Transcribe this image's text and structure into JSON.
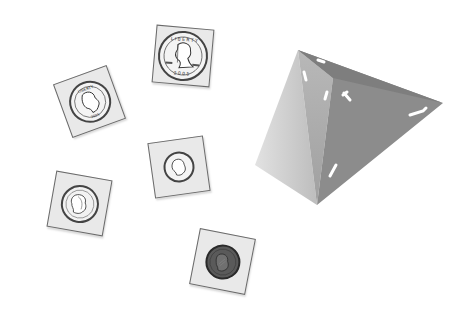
{
  "scene": {
    "description": "Five U.S. coins in cardboard coin holders and a four-sided die",
    "background": "#ffffff",
    "card_color": "#e9e9e9"
  },
  "coins": [
    {
      "name": "half dollar",
      "portrait": "Kennedy",
      "lettering_top": "LIBERTY",
      "lettering_bottom": "2005",
      "x": 183,
      "y": 56,
      "card_size": 58,
      "coin_size": 50,
      "rotate": 5,
      "fill": "#f4f4f4"
    },
    {
      "name": "quarter",
      "portrait": "Washington",
      "lettering_top": "LIBERTY",
      "x": 90,
      "y": 102,
      "card_size": 57,
      "coin_size": 42,
      "rotate": -20,
      "fill": "#f4f4f4"
    },
    {
      "name": "dime",
      "portrait": "Roosevelt",
      "x": 179,
      "y": 167,
      "card_size": 56,
      "coin_size": 31,
      "rotate": -8,
      "fill": "#f4f4f4"
    },
    {
      "name": "nickel",
      "portrait": "Jefferson",
      "x": 80,
      "y": 204,
      "card_size": 57,
      "coin_size": 38,
      "rotate": 10,
      "fill": "#f2f2f2"
    },
    {
      "name": "penny",
      "portrait": "Lincoln",
      "x": 223,
      "y": 262,
      "card_size": 57,
      "coin_size": 35,
      "rotate": 11,
      "fill": "#5a5a5a"
    }
  ],
  "die": {
    "type": "four-sided die (tetrahedron)",
    "faces": {
      "left": "#cfcfcf",
      "middle": "#a8a8a8",
      "right": "#8c8c8c"
    },
    "marks": [
      "1",
      "1",
      "1",
      "1"
    ]
  }
}
